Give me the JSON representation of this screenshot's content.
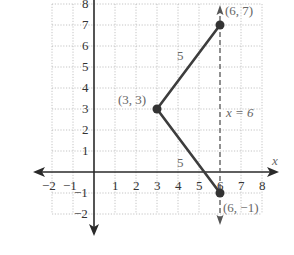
{
  "figure": {
    "title": "",
    "grid": {
      "x_min": -2,
      "x_max": 8,
      "y_min": -2,
      "y_max": 8,
      "unit_px": 21,
      "origin_px": [
        94,
        172
      ]
    },
    "axes": {
      "x_label": "x",
      "x_ticks": [
        "−2",
        "−1",
        "1",
        "2",
        "3",
        "4",
        "5",
        "6",
        "7",
        "8"
      ],
      "y_ticks": [
        "8",
        "7",
        "6",
        "5",
        "4",
        "3",
        "2",
        "1",
        "−1",
        "−2"
      ]
    },
    "points": [
      {
        "label": "(6, 7)",
        "x": 6,
        "y": 7
      },
      {
        "label": "(3, 3)",
        "x": 3,
        "y": 3
      },
      {
        "label": "(6, −1)",
        "x": 6,
        "y": -1
      }
    ],
    "segments": [
      {
        "from": "(3, 3)",
        "to": "(6, 7)",
        "length_label": "5"
      },
      {
        "from": "(3, 3)",
        "to": "(6, −1)",
        "length_label": "5"
      }
    ],
    "line_of_symmetry": {
      "label": "x = 6",
      "x": 6,
      "style": "dashed"
    },
    "colors": {
      "axis": "#2a2a2a",
      "segment": "#3d3d3d",
      "grid": "#b5b5b5",
      "annotation": "#666666"
    }
  }
}
